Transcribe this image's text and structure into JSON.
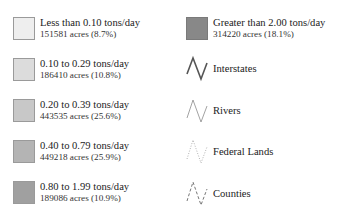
{
  "legend": {
    "classes": [
      {
        "range": "Less than 0.10 tons/day",
        "acres": "151581 acres (8.7%)",
        "color": "#eeeeee"
      },
      {
        "range": "0.10 to 0.29 tons/day",
        "acres": "186410 acres (10.8%)",
        "color": "#dcdcdc"
      },
      {
        "range": "0.20 to 0.39 tons/day",
        "acres": "443535 acres (25.6%)",
        "color": "#c8c8c8"
      },
      {
        "range": "0.40 to 0.79 tons/day",
        "acres": "449218 acres (25.9%)",
        "color": "#b4b4b4"
      },
      {
        "range": "0.80 to 1.99 tons/day",
        "acres": "189086 acres (10.9%)",
        "color": "#a0a0a0"
      },
      {
        "range": "Greater than 2.00 tons/day",
        "acres": "314220 acres (18.1%)",
        "color": "#888888"
      }
    ],
    "lines": [
      {
        "label": "Interstates",
        "style": "solid-thick",
        "color": "#555555"
      },
      {
        "label": "Rivers",
        "style": "solid-thin",
        "color": "#888888"
      },
      {
        "label": "Federal Lands",
        "style": "dotted",
        "color": "#aaaaaa"
      },
      {
        "label": "Counties",
        "style": "dashed",
        "color": "#666666"
      }
    ]
  }
}
